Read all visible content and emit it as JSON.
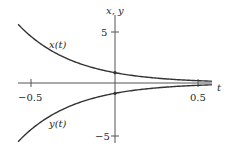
{
  "chart_data": {
    "type": "line",
    "title": "",
    "xlabel": "t",
    "ylabel": "x, y",
    "xlim": [
      -0.58,
      0.58
    ],
    "ylim": [
      -5.6,
      5.7
    ],
    "x_ticks": [
      {
        "value": -0.5,
        "label": "-0.5"
      },
      {
        "value": 0.5,
        "label": "0.5"
      }
    ],
    "y_ticks": [
      {
        "value": 5,
        "label": "5"
      },
      {
        "value": -5,
        "label": "-5"
      }
    ],
    "grid": false,
    "series": [
      {
        "name": "x(t)",
        "formula": "e^(-3t)",
        "points": [
          [
            -0.58,
            5.7
          ],
          [
            -0.5,
            4.48
          ],
          [
            -0.25,
            2.12
          ],
          [
            0,
            1.0
          ],
          [
            0.25,
            0.47
          ],
          [
            0.5,
            0.22
          ],
          [
            0.58,
            0.18
          ]
        ],
        "marker_at_zero": [
          0,
          1
        ]
      },
      {
        "name": "y(t)",
        "formula": "-e^(-3t)",
        "points": [
          [
            -0.58,
            -5.7
          ],
          [
            -0.5,
            -4.48
          ],
          [
            -0.25,
            -2.12
          ],
          [
            0,
            -1.0
          ],
          [
            0.25,
            -0.47
          ],
          [
            0.5,
            -0.22
          ],
          [
            0.58,
            -0.18
          ]
        ],
        "marker_at_zero": [
          0,
          -1
        ]
      }
    ],
    "annotations": [
      {
        "text": "x(t)",
        "near": "upper-left curve"
      },
      {
        "text": "y(t)",
        "near": "lower-left curve"
      }
    ]
  },
  "labels": {
    "axis_t": "t",
    "axis_xy": "x, y",
    "tick_neg_half": "−0.5",
    "tick_pos_half": "0.5",
    "tick_pos_five": "5",
    "tick_neg_five": "−5",
    "curve_x": "x(t)",
    "curve_y": "y(t)"
  },
  "colors": {
    "curve": "#333333",
    "axis": "#555555"
  }
}
